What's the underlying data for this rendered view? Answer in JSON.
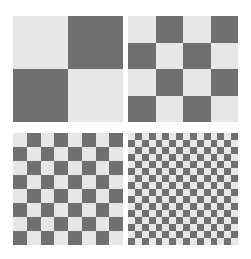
{
  "figure": {
    "background_color": "#ffffff",
    "width": 251,
    "height": 259,
    "layout": "2x2 panel grid"
  },
  "colors": {
    "light": "#e7e7e5",
    "dark": "#707070",
    "background": "#ffffff"
  },
  "chart_data": {
    "type": "heatmap",
    "title": "",
    "subtitle": "",
    "xlabel": "",
    "ylabel": "",
    "grid": false,
    "legend_position": "none",
    "panels": [
      {
        "index": 0,
        "position": "top-left",
        "rows": 2,
        "cols": 2,
        "cell_size_px": 55,
        "first_cell": "light",
        "label": "2x2 checkerboard"
      },
      {
        "index": 1,
        "position": "top-right",
        "rows": 4,
        "cols": 4,
        "cell_size_px": 27.5,
        "first_cell": "light",
        "label": "4x4 checkerboard"
      },
      {
        "index": 2,
        "position": "bottom-left",
        "rows": 8,
        "cols": 8,
        "cell_size_px": 13.75,
        "first_cell": "light",
        "label": "8x8 checkerboard"
      },
      {
        "index": 3,
        "position": "bottom-right",
        "rows": 16,
        "cols": 16,
        "cell_size_px": 6.875,
        "first_cell": "light",
        "label": "16x16 checkerboard"
      }
    ]
  }
}
